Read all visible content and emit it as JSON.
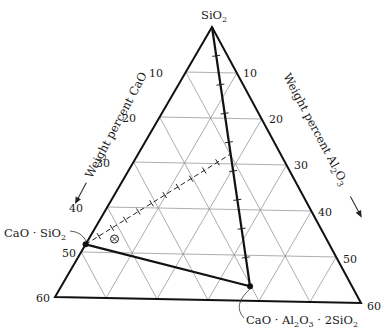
{
  "chart_data": {
    "type": "ternary-diagram",
    "title": "",
    "vertices": {
      "top": "SiO₂",
      "bottom_left_axis_max": "60",
      "bottom_right_axis_max": "60"
    },
    "axes": {
      "left": {
        "label": "Weight percent CaO",
        "ticks": [
          "10",
          "20",
          "30",
          "40",
          "50",
          "60"
        ],
        "arrow": "down-left"
      },
      "right": {
        "label_prefix": "Weight percent Al",
        "label_sub1": "2",
        "label_mid": "O",
        "label_sub2": "3",
        "ticks": [
          "10",
          "20",
          "30",
          "40",
          "50",
          "60"
        ],
        "arrow": "down-right"
      }
    },
    "grid": {
      "step": 10,
      "max": 60
    },
    "compounds": [
      {
        "name": "CaO · SiO₂",
        "CaO": 48.3,
        "Al2O3": 0,
        "SiO2": 51.7
      },
      {
        "name": "CaO · Al₂O₃ · 2SiO₂",
        "CaO": 20.2,
        "Al2O3": 36.6,
        "SiO2": 43.2
      }
    ],
    "lines": [
      {
        "from": "SiO₂",
        "to": "CaO · Al₂O₃ · 2SiO₂",
        "style": "solid-thick",
        "ticks": 8
      },
      {
        "from": "CaO · SiO₂",
        "to": "CaO · Al₂O₃ · 2SiO₂",
        "style": "solid-thick"
      },
      {
        "from": "CaO · SiO₂",
        "to": "point on SiO₂–anorthite join",
        "style": "dashed",
        "ticks": 10
      }
    ],
    "marked_point": {
      "symbol": "circled-x",
      "CaO": 42,
      "Al2O3": 5
    }
  },
  "labels": {
    "apex": "SiO",
    "apex_sub": "2",
    "wollastonite_main": "CaO · SiO",
    "wollastonite_sub": "2",
    "anorthite_a": "CaO · Al",
    "anorthite_sub1": "2",
    "anorthite_b": "O",
    "anorthite_sub2": "3",
    "anorthite_c": " · 2SiO",
    "anorthite_sub3": "2",
    "left_axis": "Weight percent CaO",
    "right_axis_a": "Weight percent Al",
    "right_axis_sub1": "2",
    "right_axis_b": "O",
    "right_axis_sub2": "3"
  },
  "ticks": {
    "left": [
      "10",
      "20",
      "30",
      "40",
      "50",
      "60"
    ],
    "right": [
      "10",
      "20",
      "30",
      "40",
      "50",
      "60"
    ]
  }
}
